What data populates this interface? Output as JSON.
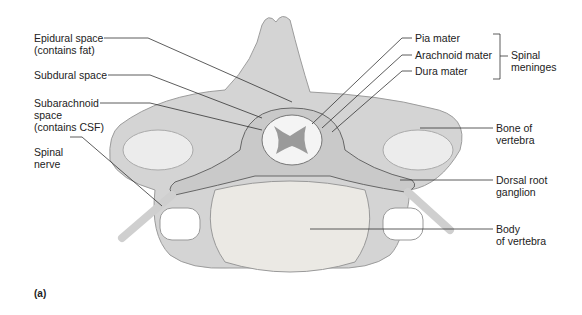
{
  "figure": {
    "panel_label": "(a)"
  },
  "labels_left": [
    {
      "id": "epidural",
      "lines": [
        "Epidural space",
        "(contains fat)"
      ]
    },
    {
      "id": "subdural",
      "lines": [
        "Subdural space"
      ]
    },
    {
      "id": "subarachnoid",
      "lines": [
        "Subarachnoid",
        "space",
        "(contains CSF)"
      ]
    },
    {
      "id": "spinal-nerve",
      "lines": [
        "Spinal",
        "nerve"
      ]
    }
  ],
  "labels_right": [
    {
      "id": "pia",
      "lines": [
        "Pia mater"
      ]
    },
    {
      "id": "arachnoid",
      "lines": [
        "Arachnoid mater"
      ]
    },
    {
      "id": "dura",
      "lines": [
        "Dura mater"
      ]
    },
    {
      "id": "bone",
      "lines": [
        "Bone of",
        "vertebra"
      ]
    },
    {
      "id": "drg",
      "lines": [
        "Dorsal root",
        "ganglion"
      ]
    },
    {
      "id": "body",
      "lines": [
        "Body",
        "of vertebra"
      ]
    }
  ],
  "bracket_group": {
    "lines": [
      "Spinal",
      "meninges"
    ]
  },
  "colors": {
    "bone": "#d6d6d6",
    "bone_dark": "#a8a8a8",
    "cord": "#f2f2f2",
    "gray_matter": "#9a9a9a",
    "leader": "#333333"
  }
}
